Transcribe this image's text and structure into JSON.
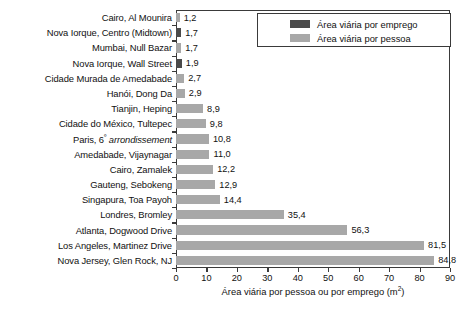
{
  "chart_data": {
    "type": "bar",
    "orientation": "horizontal",
    "title": "",
    "xlabel": "Área viária por pessoa ou por emprego (m2)",
    "ylabel": "",
    "xlim": [
      0,
      90
    ],
    "xticks": [
      0,
      10,
      20,
      30,
      40,
      50,
      60,
      70,
      80,
      90
    ],
    "xtick_labels": [
      "0",
      "10",
      "20",
      "30",
      "40",
      "50",
      "60",
      "70",
      "80",
      "90"
    ],
    "grid": false,
    "legend_position": "top-right",
    "decimal_separator": ",",
    "categories": [
      "Cairo, Al Mounira",
      "Nova Iorque, Centro (Midtown)",
      "Mumbai, Null Bazar",
      "Nova Iorque, Wall Street",
      "Cidade Murada de Amedabade",
      "Hanói, Dong Da",
      "Tianjin, Heping",
      "Cidade do México, Tultepec",
      "Paris, 6º arrondissement",
      "Amedabade, Vijaynagar",
      "Cairo, Zamalek",
      "Gauteng, Sebokeng",
      "Singapura, Toa Payoh",
      "Londres, Bromley",
      "Atlanta, Dogwood Drive",
      "Los Angeles, Martinez Drive",
      "Nova Jersey, Glen Rock, NJ"
    ],
    "values": [
      1.2,
      1.7,
      1.7,
      1.9,
      2.7,
      2.9,
      8.9,
      9.8,
      10.8,
      11.0,
      12.2,
      12.9,
      14.4,
      35.4,
      56.3,
      81.5,
      84.8
    ],
    "value_labels": [
      "1,2",
      "1,7",
      "1,7",
      "1,9",
      "2,7",
      "2,9",
      "8,9",
      "9,8",
      "10,8",
      "11,0",
      "12,2",
      "12,9",
      "14,4",
      "35,4",
      "56,3",
      "81,5",
      "84,8"
    ],
    "series_of_bar": [
      "pessoa",
      "emprego",
      "pessoa",
      "emprego",
      "pessoa",
      "pessoa",
      "pessoa",
      "pessoa",
      "pessoa",
      "pessoa",
      "pessoa",
      "pessoa",
      "pessoa",
      "pessoa",
      "pessoa",
      "pessoa",
      "pessoa"
    ],
    "series": [
      {
        "name": "Área viária por emprego",
        "color": "#4a4a4a"
      },
      {
        "name": "Área viária por pessoa",
        "color": "#a8a8a8"
      }
    ]
  },
  "legend": {
    "items": [
      {
        "label": "Área viária por emprego",
        "color": "#4a4a4a",
        "key": "emprego"
      },
      {
        "label": "Área viária por pessoa",
        "color": "#a8a8a8",
        "key": "pessoa"
      }
    ]
  },
  "axis": {
    "x_title_main": "Área viária por pessoa ou por emprego (m",
    "x_title_sup": "2",
    "x_title_tail": ")"
  },
  "category_label_parts": {
    "paris_prefix": "Paris, 6",
    "paris_sup": "º",
    "paris_italic": "arrondissement"
  },
  "colors": {
    "bar_emprego": "#4a4a4a",
    "bar_pessoa": "#a8a8a8",
    "axis": "#3a3a3a",
    "text": "#111111",
    "background": "#ffffff"
  }
}
